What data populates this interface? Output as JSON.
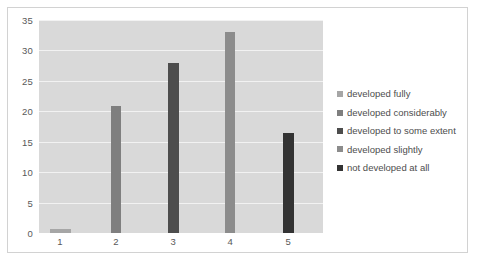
{
  "chart_data": {
    "type": "bar",
    "title": "",
    "subtitle": "",
    "xlabel": "",
    "ylabel": "",
    "categories": [
      "1",
      "2",
      "3",
      "4",
      "5"
    ],
    "values": [
      0.7,
      20.8,
      28.0,
      33.0,
      16.5
    ],
    "ylim": [
      0,
      35
    ],
    "y_ticks": [
      "0",
      "5",
      "10",
      "15",
      "20",
      "25",
      "30",
      "35"
    ],
    "y_tick_values": [
      0,
      5,
      10,
      15,
      20,
      25,
      30,
      35
    ],
    "grid": true,
    "legend_position": "right",
    "series": [
      {
        "name": "developed fully",
        "category": "1",
        "value": 0.7,
        "color": "#a6a6a6"
      },
      {
        "name": "developed considerably",
        "category": "2",
        "value": 20.8,
        "color": "#7f7f7f"
      },
      {
        "name": "developed to some extent",
        "category": "3",
        "value": 28.0,
        "color": "#4d4d4d"
      },
      {
        "name": "developed  slightly",
        "category": "4",
        "value": 33.0,
        "color": "#8c8c8c"
      },
      {
        "name": "not developed at all",
        "category": "5",
        "value": 16.5,
        "color": "#333333"
      }
    ],
    "bar_geometry": [
      {
        "center_pct": 7.4,
        "width_pct": 7.4
      },
      {
        "center_pct": 27.1,
        "width_pct": 3.6
      },
      {
        "center_pct": 47.2,
        "width_pct": 3.9
      },
      {
        "center_pct": 67.3,
        "width_pct": 3.6
      },
      {
        "center_pct": 87.7,
        "width_pct": 3.9
      }
    ],
    "colors": {
      "plot_background": "#d9d9d9",
      "gridline": "#f2f2f2",
      "frame_border": "#d2d2d2",
      "axis_text": "#595959",
      "legend_text": "#4d4d4d",
      "page_background": "#ffffff"
    }
  }
}
